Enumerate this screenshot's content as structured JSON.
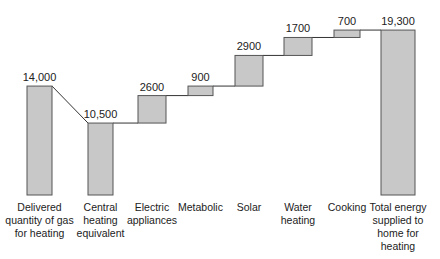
{
  "chart_data": {
    "type": "bar",
    "subtype": "waterfall",
    "title": "",
    "xlabel": "",
    "ylabel": "",
    "grid": false,
    "legend": "none",
    "categories": [
      [
        "Delivered",
        "quantity of gas",
        "for heating"
      ],
      [
        "Central",
        "heating",
        "equivalent"
      ],
      [
        "Electric",
        "appliances"
      ],
      [
        "Metabolic"
      ],
      [
        "Solar"
      ],
      [
        "Water",
        "heating"
      ],
      [
        "Cooking"
      ],
      [
        "Total energy",
        "supplied to",
        "home for",
        "heating"
      ]
    ],
    "values": [
      14000,
      10500,
      2600,
      900,
      2900,
      1700,
      700,
      19300
    ],
    "labels": [
      "14,000",
      "10,500",
      "2600",
      "900",
      "2900",
      "1700",
      "700",
      "19,300"
    ],
    "kinds": [
      "total",
      "total",
      "increment",
      "increment",
      "increment",
      "increment",
      "increment",
      "total"
    ],
    "colors": {
      "bar_fill": "#c8c8c8",
      "bar_stroke": "#555555",
      "connector": "#333333"
    }
  }
}
